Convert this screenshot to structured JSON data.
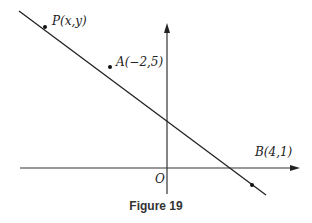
{
  "figure": {
    "caption": "Figure 19",
    "origin_label": "O",
    "points": [
      {
        "name": "P",
        "label": "P(x,y)"
      },
      {
        "name": "A",
        "label": "A(−2,5)"
      },
      {
        "name": "B",
        "label": "B(4,1)"
      }
    ],
    "line_color": "#222222",
    "axis_color": "#333333"
  }
}
